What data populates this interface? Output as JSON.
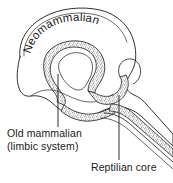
{
  "figure": {
    "name": "triune-brain-diagram",
    "width": 173,
    "height": 183,
    "background_color": "#ffffff",
    "ink_color": "#1a1a1a",
    "stipple_color": "#8a8a8a"
  },
  "labels": {
    "neomammalian": {
      "text": "Neomammalian",
      "characters": [
        "N",
        "e",
        "o",
        "m",
        "a",
        "m",
        "m",
        "a",
        "l",
        "i",
        "a",
        "n"
      ],
      "style": "curved-along-arc",
      "region": "neocortex"
    },
    "old_mammalian": {
      "line1": "Old mammalian",
      "line2": "(limbic system)",
      "region": "limbic-system"
    },
    "reptilian_core": {
      "text": "Reptilian core",
      "region": "brainstem"
    }
  },
  "leader_lines": [
    {
      "name": "leader-old-mammalian",
      "from_label": "Old mammalian (limbic system)",
      "to_region": "limbic-system"
    },
    {
      "name": "leader-reptilian-core",
      "from_label": "Reptilian core",
      "to_region": "brainstem"
    }
  ],
  "regions": [
    {
      "name": "neocortex",
      "label": "Neomammalian",
      "fill": "none",
      "stroke": "#1a1a1a"
    },
    {
      "name": "limbic-system",
      "label": "Old mammalian (limbic system)",
      "fill": "stipple",
      "stroke": "#1a1a1a"
    },
    {
      "name": "brainstem",
      "label": "Reptilian core",
      "fill": "stipple",
      "stroke": "#1a1a1a"
    }
  ]
}
